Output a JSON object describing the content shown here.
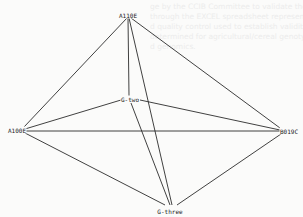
{
  "diagram": {
    "type": "network-graph",
    "nodes": [
      {
        "id": "A110E",
        "label": "A110E",
        "x": 128,
        "y": 15
      },
      {
        "id": "A100E",
        "label": "A100E",
        "x": 17,
        "y": 130
      },
      {
        "id": "G-two",
        "label": "G-two",
        "x": 130,
        "y": 99
      },
      {
        "id": "B019C",
        "label": "B019C",
        "x": 289,
        "y": 131
      },
      {
        "id": "G-three",
        "label": "G-three",
        "x": 170,
        "y": 211
      }
    ],
    "edges": [
      {
        "from": "A110E",
        "to": "A100E",
        "x1": 127,
        "y1": 18,
        "x2": 24,
        "y2": 127
      },
      {
        "from": "A110E",
        "to": "B019C",
        "x1": 131,
        "y1": 18,
        "x2": 280,
        "y2": 128
      },
      {
        "from": "A110E",
        "to": "G-two",
        "x1": 128,
        "y1": 18,
        "x2": 129,
        "y2": 96
      },
      {
        "from": "A110E",
        "to": "G-three",
        "x1": 129,
        "y1": 18,
        "x2": 172,
        "y2": 205
      },
      {
        "from": "A100E",
        "to": "G-two",
        "x1": 25,
        "y1": 129,
        "x2": 121,
        "y2": 100
      },
      {
        "from": "A100E",
        "to": "B019C",
        "x1": 25,
        "y1": 131,
        "x2": 280,
        "y2": 131
      },
      {
        "from": "A100E",
        "to": "G-three",
        "x1": 25,
        "y1": 133,
        "x2": 165,
        "y2": 205
      },
      {
        "from": "G-two",
        "to": "B019C",
        "x1": 140,
        "y1": 100,
        "x2": 280,
        "y2": 130
      },
      {
        "from": "G-two",
        "to": "G-three",
        "x1": 131,
        "y1": 103,
        "x2": 170,
        "y2": 205
      },
      {
        "from": "B019C",
        "to": "G-three",
        "x1": 281,
        "y1": 134,
        "x2": 177,
        "y2": 205
      }
    ]
  },
  "ghost_text": {
    "lines": [
      "ge by the CCIB Committee to validate the data/biom",
      "through the EXCEL spreadsheet representation reliability",
      "d quality control used to establish validity and a community",
      "determined for agricultural/cereal genotypes following the Ud",
      "d genomics."
    ]
  }
}
